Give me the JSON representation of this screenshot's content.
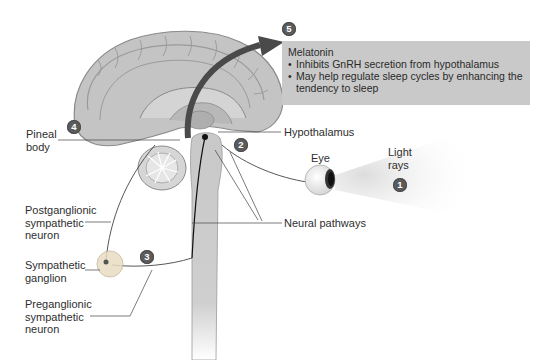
{
  "diagram": {
    "steps": [
      {
        "number": "1",
        "label": "Light rays"
      },
      {
        "number": "2",
        "label": "Hypothalamus"
      },
      {
        "number": "3",
        "label": "Sympathetic ganglion"
      },
      {
        "number": "4",
        "label": "Pineal body"
      },
      {
        "number": "5",
        "label": "Melatonin"
      }
    ],
    "labels": {
      "pineal_line1": "Pineal",
      "pineal_line2": "body",
      "hypothalamus": "Hypothalamus",
      "eye": "Eye",
      "light_line1": "Light",
      "light_line2": "rays",
      "neural_pathways": "Neural pathways",
      "postganglionic_line1": "Postganglionic",
      "postganglionic_line2": "sympathetic",
      "postganglionic_line3": "neuron",
      "sympathetic_line1": "Sympathetic",
      "sympathetic_line2": "ganglion",
      "preganglionic_line1": "Preganglionic",
      "preganglionic_line2": "sympathetic",
      "preganglionic_line3": "neuron"
    },
    "badges": {
      "b1": "1",
      "b2": "2",
      "b3": "3",
      "b4": "4",
      "b5": "5"
    },
    "infobox": {
      "title": "Melatonin",
      "bullets": [
        "Inhibits GnRH secretion from hypothalamus",
        "May help regulate sleep cycles by enhancing the tendency to sleep"
      ]
    },
    "colors": {
      "brain": "#c4c4c4",
      "brain_outline": "#8a8a8a",
      "infobox_bg": "#c9c9c9",
      "badge": "#5b5b5b",
      "arrow": "#4a4a4a"
    }
  }
}
